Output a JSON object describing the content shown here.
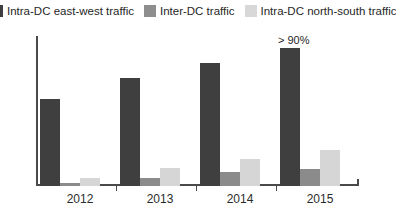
{
  "legend": {
    "items": [
      {
        "label": "Intra-DC east-west traffic",
        "color": "#3f3f3f",
        "swatch": "dark"
      },
      {
        "label": "Inter-DC traffic",
        "color": "#8e8e8e",
        "swatch": "mid"
      },
      {
        "label": "Intra-DC north-south traffic",
        "color": "#d8d8d8",
        "swatch": "light"
      }
    ]
  },
  "axis": {
    "x_labels": [
      "2012",
      "2013",
      "2014",
      "2015"
    ]
  },
  "annotations": {
    "bar_2015_east_west": "> 90%"
  },
  "chart_data": {
    "type": "bar",
    "title": "",
    "subtitle": "",
    "xlabel": "",
    "ylabel": "",
    "categories": [
      "2012",
      "2013",
      "2014",
      "2015"
    ],
    "series": [
      {
        "name": "Intra-DC east-west traffic",
        "color": "#3f3f3f",
        "values": [
          58,
          72,
          82,
          92
        ]
      },
      {
        "name": "Inter-DC traffic",
        "color": "#8b8b8b",
        "values": [
          2,
          5,
          9,
          11
        ]
      },
      {
        "name": "Intra-DC north-south traffic",
        "color": "#d6d6d6",
        "values": [
          5,
          12,
          18,
          24
        ]
      }
    ],
    "ylim": [
      0,
      100
    ],
    "grid": false,
    "legend_position": "top",
    "data_labels": {
      "2015": {
        "Intra-DC east-west traffic": "> 90%"
      }
    }
  }
}
